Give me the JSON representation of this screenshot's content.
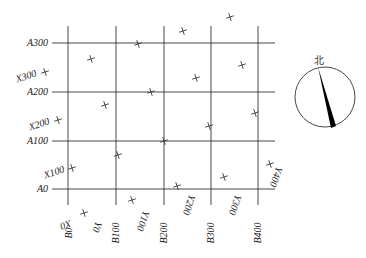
{
  "diagram": {
    "type": "coordinate-grid-with-north-arrow",
    "grid": {
      "vertical_lines": [
        {
          "label": "B0",
          "x": 68
        },
        {
          "label": "B100",
          "x": 116
        },
        {
          "label": "B200",
          "x": 164
        },
        {
          "label": "B300",
          "x": 211
        },
        {
          "label": "B400",
          "x": 258
        }
      ],
      "horizontal_lines": [
        {
          "label": "A300",
          "y": 43
        },
        {
          "label": "A200",
          "y": 92
        },
        {
          "label": "A100",
          "y": 141
        },
        {
          "label": "A0",
          "y": 189
        }
      ]
    },
    "labels": {
      "a300": "A300",
      "a200": "A200",
      "a100": "A100",
      "a0": "A0",
      "b0": "B0",
      "b100": "B100",
      "b200": "B200",
      "b300": "B300",
      "b400": "B400",
      "x0": "X0",
      "x100": "X100",
      "x200": "X200",
      "x300": "X300",
      "y0": "Y0",
      "y100": "Y100",
      "y200": "Y200",
      "y300": "Y300",
      "y400": "Y400"
    },
    "crosses": [
      {
        "x": 45,
        "y": 72
      },
      {
        "x": 58,
        "y": 120
      },
      {
        "x": 72,
        "y": 168
      },
      {
        "x": 84,
        "y": 213
      },
      {
        "x": 91,
        "y": 59
      },
      {
        "x": 105,
        "y": 105
      },
      {
        "x": 118,
        "y": 155
      },
      {
        "x": 132,
        "y": 200
      },
      {
        "x": 138,
        "y": 44
      },
      {
        "x": 151,
        "y": 92
      },
      {
        "x": 164,
        "y": 141
      },
      {
        "x": 177,
        "y": 186
      },
      {
        "x": 183,
        "y": 31
      },
      {
        "x": 196,
        "y": 78
      },
      {
        "x": 209,
        "y": 126
      },
      {
        "x": 224,
        "y": 177
      },
      {
        "x": 230,
        "y": 17
      },
      {
        "x": 242,
        "y": 65
      },
      {
        "x": 255,
        "y": 113
      },
      {
        "x": 270,
        "y": 164
      }
    ],
    "compass": {
      "north_label": "北",
      "center_x": 325,
      "center_y": 97,
      "radius": 30,
      "needle_color": "#000000"
    }
  }
}
